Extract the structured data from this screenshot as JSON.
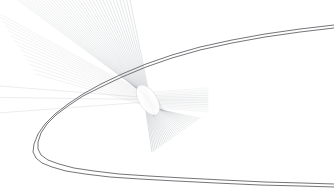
{
  "figure": {
    "width": 334,
    "height": 189,
    "background_color": "#ffffff"
  },
  "chart_data": {
    "type": "scatter",
    "subtitle": "",
    "xlabel": "",
    "ylabel": "",
    "xlim": [
      0,
      334
    ],
    "ylim": [
      0,
      189
    ],
    "grid": false,
    "legend": "none",
    "annotations": [],
    "tick_labels": {
      "x": [],
      "y": []
    },
    "series": [
      {
        "name": "reflector-arc-outer",
        "type": "line",
        "color": "#6e6e72",
        "width": 1.0,
        "opacity": 0.95,
        "comment": "large rightward-opening parabolic arc, outer trace",
        "points": [
          [
            334,
            25
          ],
          [
            300,
            29
          ],
          [
            265,
            34
          ],
          [
            232,
            40
          ],
          [
            200,
            47
          ],
          [
            172,
            55
          ],
          [
            146,
            64
          ],
          [
            122,
            74
          ],
          [
            101,
            84
          ],
          [
            83,
            94
          ],
          [
            68,
            104
          ],
          [
            55,
            114
          ],
          [
            45,
            124
          ],
          [
            38,
            134
          ],
          [
            34,
            144
          ],
          [
            33,
            152
          ],
          [
            36,
            158
          ],
          [
            42,
            163
          ],
          [
            52,
            167
          ],
          [
            66,
            171
          ],
          [
            85,
            174
          ],
          [
            110,
            177
          ],
          [
            140,
            179
          ],
          [
            176,
            181
          ],
          [
            216,
            183
          ],
          [
            260,
            185
          ],
          [
            300,
            186
          ],
          [
            334,
            187
          ]
        ]
      },
      {
        "name": "reflector-arc-inner",
        "type": "line",
        "color": "#6e6e72",
        "width": 1.0,
        "opacity": 0.95,
        "comment": "large rightward-opening parabolic arc, inner trace offset ~3px",
        "points": [
          [
            334,
            28
          ],
          [
            300,
            32
          ],
          [
            265,
            37
          ],
          [
            232,
            43
          ],
          [
            200,
            50
          ],
          [
            172,
            58
          ],
          [
            146,
            67
          ],
          [
            122,
            77
          ],
          [
            101,
            87
          ],
          [
            83,
            96
          ],
          [
            68,
            106
          ],
          [
            56,
            115
          ],
          [
            47,
            124
          ],
          [
            41,
            133
          ],
          [
            38,
            142
          ],
          [
            38,
            149
          ],
          [
            41,
            155
          ],
          [
            48,
            160
          ],
          [
            59,
            164
          ],
          [
            74,
            168
          ],
          [
            94,
            171
          ],
          [
            119,
            174
          ],
          [
            149,
            176
          ],
          [
            184,
            178
          ],
          [
            223,
            180
          ],
          [
            265,
            182
          ],
          [
            302,
            183
          ],
          [
            334,
            184
          ]
        ]
      },
      {
        "name": "incident-ray-fan-upper-left",
        "type": "line",
        "color": "#9aa0a6",
        "width": 0.55,
        "opacity": 0.5,
        "comment": "fan of parallel-ish rays arriving from upper-left, converging to focal caustic",
        "origins_x_range": [
          18,
          130
        ],
        "origins_y": 0,
        "focus": [
          148,
          100
        ],
        "count": 34
      },
      {
        "name": "emergent-ray-fan-lower-right",
        "type": "line",
        "color": "#8d9399",
        "width": 0.55,
        "opacity": 0.55,
        "comment": "rays diverging from caustic toward lower-right, truncated mid-field",
        "focus": [
          148,
          100
        ],
        "end_x_range": [
          152,
          200
        ],
        "end_y_range": [
          118,
          152
        ],
        "count": 30
      },
      {
        "name": "emergent-ray-fan-right",
        "type": "line",
        "color": "#9aa0a6",
        "width": 0.5,
        "opacity": 0.45,
        "comment": "shallow rays leaving caustic toward the right edge",
        "focus": [
          148,
          100
        ],
        "end_x": 208,
        "end_y_range": [
          88,
          112
        ],
        "count": 14
      },
      {
        "name": "horizontal-rays-left",
        "type": "line",
        "color": "#b3b8bd",
        "width": 0.5,
        "opacity": 0.5,
        "comment": "near-horizontal rays extending to the left edge",
        "y_values": [
          86,
          97,
          112
        ],
        "x_range": [
          0,
          150
        ]
      },
      {
        "name": "caustic-ellipse",
        "type": "ellipse",
        "color": "#ffffff",
        "edge_color": "#c9ced3",
        "comment": "bright tilted elliptical caustic / focal spot",
        "center": [
          148,
          100
        ],
        "rx": 9,
        "ry": 17,
        "rotation_deg": -32
      }
    ]
  }
}
